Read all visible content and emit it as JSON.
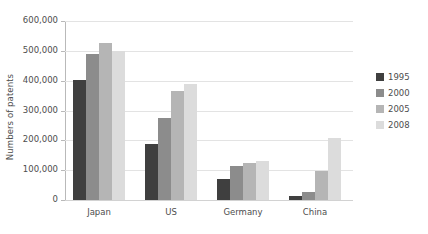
{
  "chart_data": {
    "type": "bar",
    "title": "",
    "xlabel": "",
    "ylabel": "Numbers of patents",
    "categories": [
      "Japan",
      "US",
      "Germany",
      "China"
    ],
    "series": [
      {
        "name": "1995",
        "color": "#3f3f3f",
        "values": [
          402000,
          188000,
          72000,
          13000
        ]
      },
      {
        "name": "2000",
        "color": "#8c8c8c",
        "values": [
          488000,
          275000,
          115000,
          28000
        ]
      },
      {
        "name": "2005",
        "color": "#b5b5b5",
        "values": [
          525000,
          365000,
          123000,
          98000
        ]
      },
      {
        "name": "2008",
        "color": "#dcdcdc",
        "values": [
          500000,
          390000,
          132000,
          208000
        ]
      }
    ],
    "ylim": [
      0,
      600000
    ],
    "ytick_values": [
      0,
      100000,
      200000,
      300000,
      400000,
      500000,
      600000
    ],
    "ytick_labels": [
      "0",
      "100,000",
      "200,000",
      "300,000",
      "400,000",
      "500,000",
      "600,000"
    ],
    "grid": true,
    "legend_position": "right",
    "legend_entries": [
      "1995",
      "2000",
      "2005",
      "2008"
    ]
  },
  "colors": {
    "background": "#ffffff",
    "gridline": "#e3e3e3",
    "axis": "#b9b9b9",
    "text": "#4d4d4d"
  }
}
